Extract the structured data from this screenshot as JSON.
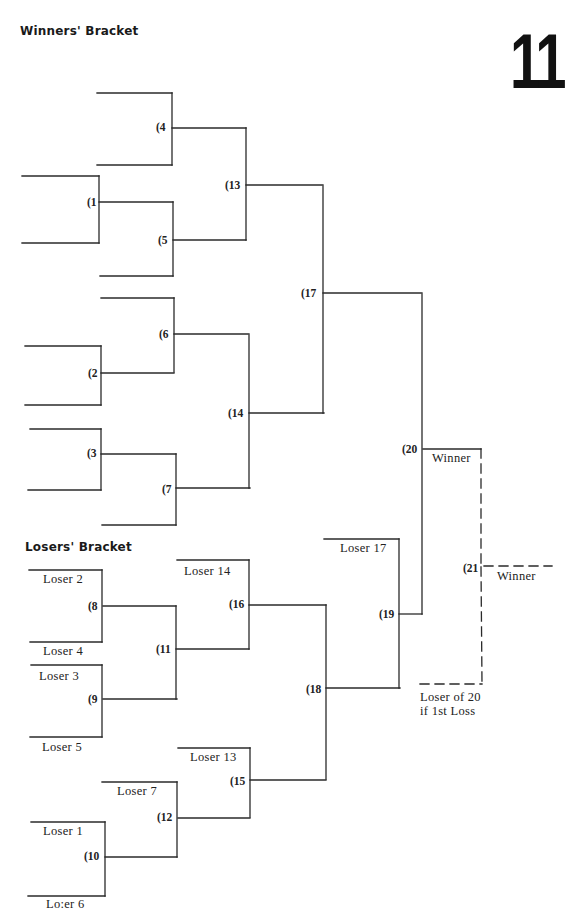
{
  "page": {
    "page_number": "11",
    "winners_bracket_title": "Winners' Bracket",
    "losers_bracket_title": "Losers' Bracket"
  },
  "winners_bracket": {
    "games": [
      {
        "id": "1",
        "label": "(1"
      },
      {
        "id": "2",
        "label": "(2"
      },
      {
        "id": "3",
        "label": "(3"
      },
      {
        "id": "4",
        "label": "(4"
      },
      {
        "id": "5",
        "label": "(5"
      },
      {
        "id": "6",
        "label": "(6"
      },
      {
        "id": "7",
        "label": "(7"
      },
      {
        "id": "13",
        "label": "(13"
      },
      {
        "id": "14",
        "label": "(14"
      },
      {
        "id": "17",
        "label": "(17"
      },
      {
        "id": "20",
        "label": "(20"
      },
      {
        "id": "21",
        "label": "(21"
      }
    ],
    "slots": {
      "winner_20": "Winner",
      "winner_21": "Winner",
      "loser_of_20_line1": "Loser of 20",
      "loser_of_20_line2": "if 1st Loss"
    }
  },
  "losers_bracket": {
    "games": [
      {
        "id": "8",
        "label": "(8"
      },
      {
        "id": "9",
        "label": "(9"
      },
      {
        "id": "10",
        "label": "(10"
      },
      {
        "id": "11",
        "label": "(11"
      },
      {
        "id": "12",
        "label": "(12"
      },
      {
        "id": "15",
        "label": "(15"
      },
      {
        "id": "16",
        "label": "(16"
      },
      {
        "id": "18",
        "label": "(18"
      },
      {
        "id": "19",
        "label": "(19"
      }
    ],
    "slots": {
      "loser_2": "Loser 2",
      "loser_4": "Loser 4",
      "loser_3": "Loser 3",
      "loser_5": "Loser 5",
      "loser_1": "Loser 1",
      "loser_6": "Lo:er 6",
      "loser_7": "Loser 7",
      "loser_13": "Loser 13",
      "loser_14": "Loser 14",
      "loser_17": "Loser 17"
    }
  },
  "colors": {
    "line": "#2a2a2a",
    "text": "#222222",
    "background": "#ffffff"
  }
}
